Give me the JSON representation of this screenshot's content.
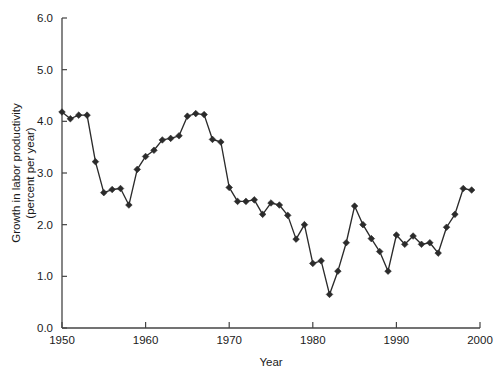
{
  "chart_data": {
    "type": "line",
    "title": "",
    "subtitle": "",
    "xlabel": "Year",
    "ylabel": "Growth in labor productivity\n(percent per year)",
    "ylabel_line1": "Growth in labor productivity",
    "ylabel_line2": "(percent per year)",
    "xlim": [
      1950,
      2000
    ],
    "ylim": [
      0.0,
      6.0
    ],
    "xticks": [
      1950,
      1960,
      1970,
      1980,
      1990,
      2000
    ],
    "xtick_labels": [
      "1950",
      "1960",
      "1970",
      "1980",
      "1990",
      "2000"
    ],
    "yticks": [
      0.0,
      1.0,
      2.0,
      3.0,
      4.0,
      5.0,
      6.0
    ],
    "ytick_labels": [
      "0.0",
      "1.0",
      "2.0",
      "3.0",
      "4.0",
      "5.0",
      "6.0"
    ],
    "grid": false,
    "legend": false,
    "legend_position": "none",
    "marker": "diamond",
    "line_color": "#2b2b2b",
    "marker_color": "#2b2b2b",
    "axis_color": "#444444",
    "background_color": "#ffffff",
    "x": [
      1950,
      1951,
      1952,
      1953,
      1954,
      1955,
      1956,
      1957,
      1958,
      1959,
      1960,
      1961,
      1962,
      1963,
      1964,
      1965,
      1966,
      1967,
      1968,
      1969,
      1970,
      1971,
      1972,
      1973,
      1974,
      1975,
      1976,
      1977,
      1978,
      1979,
      1980,
      1981,
      1982,
      1983,
      1984,
      1985,
      1986,
      1987,
      1988,
      1989,
      1990,
      1991,
      1992,
      1993,
      1994,
      1995,
      1996,
      1997,
      1998,
      1999
    ],
    "values": [
      4.18,
      4.05,
      4.12,
      4.12,
      3.22,
      2.62,
      2.68,
      2.7,
      2.38,
      3.07,
      3.32,
      3.44,
      3.64,
      3.67,
      3.72,
      4.1,
      4.15,
      4.13,
      3.65,
      3.6,
      2.72,
      2.45,
      2.45,
      2.48,
      2.2,
      2.42,
      2.38,
      2.18,
      1.72,
      2.0,
      1.25,
      1.3,
      0.65,
      1.1,
      1.65,
      2.36,
      2.0,
      1.73,
      1.48,
      1.1,
      1.8,
      1.62,
      1.78,
      1.62,
      1.65,
      1.45,
      1.95,
      2.2,
      2.7,
      2.67
    ],
    "series": [
      {
        "name": "Growth in labor productivity",
        "values": [
          4.18,
          4.05,
          4.12,
          4.12,
          3.22,
          2.62,
          2.68,
          2.7,
          2.38,
          3.07,
          3.32,
          3.44,
          3.64,
          3.67,
          3.72,
          4.1,
          4.15,
          4.13,
          3.65,
          3.6,
          2.72,
          2.45,
          2.45,
          2.48,
          2.2,
          2.42,
          2.38,
          2.18,
          1.72,
          2.0,
          1.25,
          1.3,
          0.65,
          1.1,
          1.65,
          2.36,
          2.0,
          1.73,
          1.48,
          1.1,
          1.8,
          1.62,
          1.78,
          1.62,
          1.65,
          1.45,
          1.95,
          2.2,
          2.7,
          2.67
        ]
      }
    ],
    "annotations": []
  }
}
